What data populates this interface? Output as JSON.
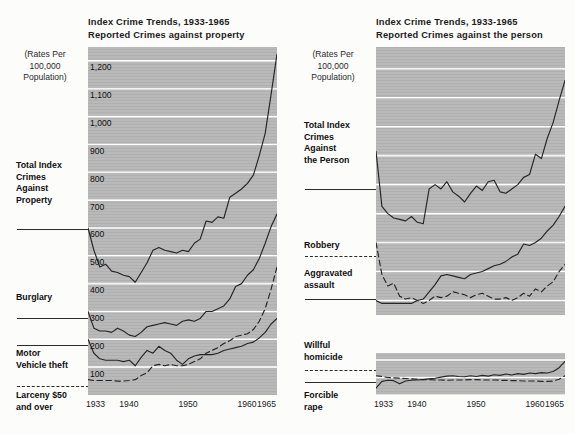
{
  "figure": {
    "rate_note_lines": [
      "(Rates Per",
      "100,000",
      "Population)"
    ],
    "x_ticks": [
      "1933",
      "1940",
      "1950",
      "1960",
      "1965"
    ],
    "x_tick_values": [
      1933,
      1940,
      1950,
      1960,
      1965
    ],
    "band_color": "#b9b9b9",
    "gridline_color": "#ffffff",
    "line_color": "#262626"
  },
  "panels": [
    {
      "id": "property",
      "title_line1": "Index Crime Trends, 1933-1965",
      "title_line2": "Reported Crimes against property",
      "side_labels": [
        {
          "name": "total-index-crimes-against-property",
          "lines": [
            "Total Index",
            "Crimes",
            "Against",
            "Property"
          ],
          "leader": "solid"
        },
        {
          "name": "burglary",
          "lines": [
            "Burglary"
          ],
          "leader": "solid"
        },
        {
          "name": "motor-vehicle-theft",
          "lines": [
            "Motor",
            "Vehicle theft"
          ],
          "leader": "solid"
        },
        {
          "name": "larceny-50-and-over",
          "lines": [
            "Larceny $50",
            "and over"
          ],
          "leader": "dashed"
        }
      ],
      "y_ticks": [
        "1,200",
        "1,100",
        "1,000",
        "900",
        "800",
        "700",
        "600",
        "500",
        "400",
        "300",
        "200",
        "100"
      ],
      "y_tick_values": [
        1200,
        1100,
        1000,
        900,
        800,
        700,
        600,
        500,
        400,
        300,
        200,
        100
      ]
    },
    {
      "id": "person",
      "title_line1": "Index Crime Trends, 1933-1965",
      "title_line2": "Reported Crimes against the person",
      "side_labels": [
        {
          "name": "total-index-crimes-against-the-person",
          "lines": [
            "Total Index",
            "Crimes",
            "Against",
            "the Person"
          ],
          "leader": "solid"
        },
        {
          "name": "robbery",
          "lines": [
            "Robbery"
          ],
          "leader": "dashed"
        },
        {
          "name": "aggravated-assault",
          "lines": [
            "Aggravated",
            "assault"
          ],
          "leader": "solid"
        },
        {
          "name": "willful-homicide",
          "lines": [
            "Willful",
            "homicide"
          ],
          "leader": "dashed"
        },
        {
          "name": "forcible-rape",
          "lines": [
            "Forcible",
            "rape"
          ],
          "leader": "solid"
        }
      ],
      "y_ticks": [
        "200",
        "180",
        "160",
        "140",
        "120",
        "100",
        "80",
        "60",
        "40"
      ],
      "y_tick_values": [
        200,
        180,
        160,
        140,
        120,
        100,
        80,
        60,
        40
      ],
      "y_ticks_lower": [
        "10",
        "5",
        "0"
      ],
      "y_tick_values_lower": [
        10,
        5,
        0
      ]
    }
  ],
  "chart_data": [
    {
      "type": "line",
      "title": "Index Crime Trends, 1933-1965 — Reported Crimes against property",
      "xlabel": "",
      "ylabel": "(Rates Per 100,000 Population)",
      "xlim": [
        1933,
        1965
      ],
      "ylim": [
        0,
        1250
      ],
      "grid": true,
      "legend": "left-margin-labels",
      "x": [
        1933,
        1934,
        1935,
        1936,
        1937,
        1938,
        1939,
        1940,
        1941,
        1942,
        1943,
        1944,
        1945,
        1946,
        1947,
        1948,
        1949,
        1950,
        1951,
        1952,
        1953,
        1954,
        1955,
        1956,
        1957,
        1958,
        1959,
        1960,
        1961,
        1962,
        1963,
        1964,
        1965
      ],
      "series": [
        {
          "name": "Total Index Crimes Against Property",
          "style": "solid",
          "values": [
            600,
            520,
            460,
            470,
            445,
            440,
            430,
            425,
            405,
            440,
            475,
            520,
            530,
            520,
            515,
            510,
            520,
            515,
            545,
            560,
            625,
            620,
            640,
            635,
            710,
            725,
            740,
            760,
            790,
            860,
            940,
            1080,
            1225
          ]
        },
        {
          "name": "Burglary",
          "style": "solid",
          "values": [
            300,
            240,
            230,
            230,
            225,
            240,
            230,
            215,
            210,
            225,
            245,
            250,
            255,
            260,
            255,
            250,
            265,
            270,
            265,
            275,
            300,
            300,
            310,
            320,
            345,
            390,
            400,
            430,
            450,
            490,
            545,
            605,
            650
          ]
        },
        {
          "name": "Motor Vehicle theft",
          "style": "solid",
          "values": [
            200,
            150,
            130,
            125,
            125,
            125,
            120,
            125,
            105,
            135,
            160,
            150,
            175,
            160,
            150,
            125,
            110,
            130,
            140,
            145,
            145,
            145,
            150,
            160,
            165,
            170,
            175,
            185,
            190,
            205,
            225,
            255,
            275
          ]
        },
        {
          "name": "Larceny $50 and over",
          "style": "dashed",
          "values": [
            55,
            52,
            52,
            52,
            52,
            50,
            50,
            52,
            55,
            70,
            80,
            105,
            110,
            105,
            110,
            105,
            105,
            110,
            120,
            130,
            150,
            160,
            170,
            185,
            195,
            210,
            215,
            220,
            235,
            265,
            310,
            380,
            460
          ]
        }
      ]
    },
    {
      "type": "line",
      "title": "Index Crime Trends, 1933-1965 — Reported Crimes against the person",
      "xlabel": "",
      "ylabel": "(Rates Per 100,000 Population)",
      "xlim": [
        1933,
        1965
      ],
      "ylim": [
        30,
        215
      ],
      "grid": true,
      "legend": "left-margin-labels",
      "x": [
        1933,
        1934,
        1935,
        1936,
        1937,
        1938,
        1939,
        1940,
        1941,
        1942,
        1943,
        1944,
        1945,
        1946,
        1947,
        1948,
        1949,
        1950,
        1951,
        1952,
        1953,
        1954,
        1955,
        1956,
        1957,
        1958,
        1959,
        1960,
        1961,
        1962,
        1963,
        1964,
        1965
      ],
      "series": [
        {
          "name": "Total Index Crimes Against the Person",
          "style": "solid",
          "values": [
            143,
            105,
            100,
            97,
            96,
            95,
            98,
            94,
            93,
            117,
            120,
            117,
            122,
            115,
            112,
            108,
            114,
            119,
            116,
            122,
            123,
            115,
            114,
            117,
            120,
            125,
            127,
            141,
            138,
            152,
            163,
            178,
            192
          ]
        },
        {
          "name": "Robbery",
          "style": "dashed",
          "values": [
            80,
            58,
            50,
            52,
            43,
            41,
            42,
            40,
            38,
            40,
            43,
            42,
            43,
            46,
            45,
            44,
            42,
            44,
            45,
            43,
            41,
            41,
            42,
            40,
            42,
            45,
            43,
            48,
            46,
            50,
            53,
            60,
            65
          ]
        },
        {
          "name": "Aggravated assault",
          "style": "solid",
          "values": [
            40,
            38,
            38,
            38,
            38,
            38,
            38,
            40,
            41,
            46,
            51,
            57,
            58,
            57,
            56,
            55,
            58,
            59,
            60,
            62,
            64,
            65,
            67,
            70,
            72,
            79,
            78,
            80,
            83,
            88,
            92,
            98,
            105
          ]
        }
      ]
    },
    {
      "type": "line",
      "title": "Willful homicide and Forcible rape rates, 1933-1965",
      "xlabel": "",
      "ylabel": "(Rates Per 100,000 Population)",
      "xlim": [
        1933,
        1965
      ],
      "ylim": [
        0,
        12
      ],
      "grid": true,
      "legend": "left-margin-labels",
      "x": [
        1933,
        1934,
        1935,
        1936,
        1937,
        1938,
        1939,
        1940,
        1941,
        1942,
        1943,
        1944,
        1945,
        1946,
        1947,
        1948,
        1949,
        1950,
        1951,
        1952,
        1953,
        1954,
        1955,
        1956,
        1957,
        1958,
        1959,
        1960,
        1961,
        1962,
        1963,
        1964,
        1965
      ],
      "series": [
        {
          "name": "Willful homicide",
          "style": "dashed",
          "values": [
            5.5,
            5.3,
            5.0,
            4.9,
            4.8,
            4.7,
            4.6,
            4.5,
            4.4,
            4.4,
            4.3,
            4.3,
            4.2,
            4.3,
            4.3,
            4.3,
            4.4,
            4.4,
            4.3,
            4.3,
            4.3,
            4.2,
            4.2,
            4.1,
            4.1,
            4.0,
            4.0,
            4.0,
            3.9,
            3.9,
            4.0,
            4.5,
            5.5
          ]
        },
        {
          "name": "Forcible rape",
          "style": "solid",
          "values": [
            2.0,
            3.9,
            4.2,
            4.1,
            3.2,
            4.0,
            4.2,
            4.3,
            4.4,
            4.6,
            4.8,
            5.1,
            5.4,
            5.5,
            5.3,
            5.2,
            5.5,
            5.3,
            5.6,
            5.4,
            5.8,
            5.6,
            6.0,
            5.7,
            6.1,
            5.9,
            6.3,
            6.1,
            6.4,
            6.3,
            6.7,
            7.8,
            9.6
          ]
        }
      ]
    }
  ]
}
